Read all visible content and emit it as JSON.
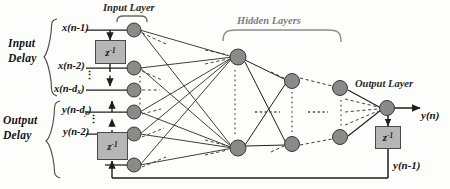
{
  "diagram": {
    "colors": {
      "node_fill": "#8a8a8a",
      "node_stroke": "#3a3a3a",
      "delay_fill": "#b6b6b6",
      "delay_stroke": "#4a4a4a",
      "line": "#1e1e1e",
      "dashed_line": "#3c3c3c",
      "background": "#fdfdfc",
      "bracket": "#4d4d4d"
    },
    "groups": [
      {
        "id": "input-delay",
        "line1": "Input",
        "line2": "Delay"
      },
      {
        "id": "output-delay",
        "line1": "Output",
        "line2": "Delay"
      }
    ],
    "layer_labels": [
      {
        "id": "input-layer",
        "text": "Input  Layer"
      },
      {
        "id": "hidden-layers",
        "text": "Hidden Layers"
      },
      {
        "id": "output-layer",
        "text": "Output Layer"
      }
    ],
    "signals": [
      {
        "id": "x-n-1",
        "base": "x(n-1)",
        "sub": "",
        "pre": "x(n-1)"
      },
      {
        "id": "x-n-2",
        "pre": "x(n",
        "sub": "",
        "post": "-2)"
      },
      {
        "id": "x-n-dx",
        "pre": "x(n-d",
        "sub": "x",
        "post": ")"
      },
      {
        "id": "y-n-dy",
        "pre": "y(n-d",
        "sub": "y",
        "post": ")"
      },
      {
        "id": "y-n-2",
        "pre": "y(n",
        "sub": "",
        "post": "-2)"
      }
    ],
    "delay_blocks": [
      {
        "id": "input-delay-block",
        "base": "z",
        "exponent": "-1"
      },
      {
        "id": "output-delay-block",
        "base": "z",
        "exponent": "-1"
      },
      {
        "id": "feedback-delay-block",
        "base": "z",
        "exponent": "-1"
      }
    ],
    "outputs": [
      {
        "id": "y-n",
        "text": "y(n)"
      },
      {
        "id": "y-n-1",
        "text": "y(n-1)"
      }
    ],
    "node_counts": {
      "input_layer": 6,
      "hidden_layer_1": 2,
      "hidden_layer_2": 2,
      "hidden_layer_3": 2,
      "output_layer": 1
    }
  }
}
